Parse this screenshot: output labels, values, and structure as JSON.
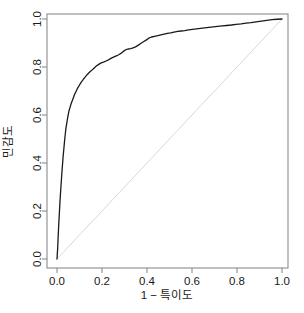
{
  "chart_data": {
    "type": "line",
    "title": "",
    "xlabel": "1 − 특이도",
    "ylabel": "민감도",
    "xlim": [
      0,
      1
    ],
    "ylim": [
      0,
      1
    ],
    "grid": false,
    "legend": "none",
    "xticks": [
      "0.0",
      "0.2",
      "0.4",
      "0.6",
      "0.8",
      "1.0"
    ],
    "xtick_values": [
      0.0,
      0.2,
      0.4,
      0.6,
      0.8,
      1.0
    ],
    "yticks": [
      "0.0",
      "0.2",
      "0.4",
      "0.6",
      "0.8",
      "1.0"
    ],
    "ytick_values": [
      0.0,
      0.2,
      0.4,
      0.6,
      0.8,
      1.0
    ],
    "series": [
      {
        "name": "roc-curve",
        "color": "#1a1a1a",
        "width": 1.3,
        "points": [
          [
            0.0,
            0.0
          ],
          [
            0.003,
            0.045
          ],
          [
            0.005,
            0.09
          ],
          [
            0.007,
            0.13
          ],
          [
            0.009,
            0.165
          ],
          [
            0.011,
            0.2
          ],
          [
            0.013,
            0.235
          ],
          [
            0.015,
            0.265
          ],
          [
            0.017,
            0.295
          ],
          [
            0.019,
            0.32
          ],
          [
            0.021,
            0.35
          ],
          [
            0.023,
            0.375
          ],
          [
            0.025,
            0.4
          ],
          [
            0.027,
            0.425
          ],
          [
            0.029,
            0.445
          ],
          [
            0.031,
            0.465
          ],
          [
            0.033,
            0.485
          ],
          [
            0.035,
            0.505
          ],
          [
            0.037,
            0.522
          ],
          [
            0.039,
            0.54
          ],
          [
            0.042,
            0.558
          ],
          [
            0.045,
            0.575
          ],
          [
            0.048,
            0.592
          ],
          [
            0.051,
            0.607
          ],
          [
            0.054,
            0.62
          ],
          [
            0.058,
            0.632
          ],
          [
            0.062,
            0.645
          ],
          [
            0.066,
            0.655
          ],
          [
            0.07,
            0.665
          ],
          [
            0.074,
            0.675
          ],
          [
            0.078,
            0.685
          ],
          [
            0.083,
            0.695
          ],
          [
            0.088,
            0.705
          ],
          [
            0.093,
            0.714
          ],
          [
            0.098,
            0.722
          ],
          [
            0.103,
            0.73
          ],
          [
            0.108,
            0.737
          ],
          [
            0.113,
            0.743
          ],
          [
            0.118,
            0.75
          ],
          [
            0.124,
            0.757
          ],
          [
            0.13,
            0.764
          ],
          [
            0.136,
            0.77
          ],
          [
            0.142,
            0.776
          ],
          [
            0.148,
            0.781
          ],
          [
            0.155,
            0.787
          ],
          [
            0.162,
            0.793
          ],
          [
            0.169,
            0.799
          ],
          [
            0.176,
            0.805
          ],
          [
            0.184,
            0.81
          ],
          [
            0.192,
            0.815
          ],
          [
            0.2,
            0.818
          ],
          [
            0.209,
            0.821
          ],
          [
            0.218,
            0.825
          ],
          [
            0.227,
            0.829
          ],
          [
            0.236,
            0.834
          ],
          [
            0.246,
            0.839
          ],
          [
            0.256,
            0.843
          ],
          [
            0.266,
            0.847
          ],
          [
            0.276,
            0.852
          ],
          [
            0.286,
            0.858
          ],
          [
            0.296,
            0.866
          ],
          [
            0.306,
            0.872
          ],
          [
            0.316,
            0.875
          ],
          [
            0.327,
            0.877
          ],
          [
            0.338,
            0.88
          ],
          [
            0.349,
            0.884
          ],
          [
            0.36,
            0.89
          ],
          [
            0.372,
            0.898
          ],
          [
            0.384,
            0.905
          ],
          [
            0.396,
            0.912
          ],
          [
            0.408,
            0.92
          ],
          [
            0.42,
            0.925
          ],
          [
            0.434,
            0.928
          ],
          [
            0.448,
            0.931
          ],
          [
            0.462,
            0.934
          ],
          [
            0.476,
            0.937
          ],
          [
            0.49,
            0.94
          ],
          [
            0.505,
            0.942
          ],
          [
            0.52,
            0.945
          ],
          [
            0.536,
            0.948
          ],
          [
            0.552,
            0.95
          ],
          [
            0.568,
            0.952
          ],
          [
            0.585,
            0.955
          ],
          [
            0.602,
            0.957
          ],
          [
            0.62,
            0.959
          ],
          [
            0.638,
            0.961
          ],
          [
            0.656,
            0.963
          ],
          [
            0.675,
            0.965
          ],
          [
            0.694,
            0.967
          ],
          [
            0.714,
            0.969
          ],
          [
            0.734,
            0.971
          ],
          [
            0.754,
            0.973
          ],
          [
            0.775,
            0.975
          ],
          [
            0.796,
            0.978
          ],
          [
            0.818,
            0.98
          ],
          [
            0.84,
            0.983
          ],
          [
            0.862,
            0.985
          ],
          [
            0.885,
            0.988
          ],
          [
            0.908,
            0.991
          ],
          [
            0.932,
            0.994
          ],
          [
            0.956,
            0.997
          ],
          [
            0.978,
            0.999
          ],
          [
            1.0,
            1.0
          ]
        ]
      },
      {
        "name": "chance-diagonal",
        "color": "#d9d9d9",
        "width": 1.0,
        "points": [
          [
            0.0,
            0.0
          ],
          [
            1.0,
            1.0
          ]
        ]
      }
    ]
  },
  "axes": {
    "frame_color": "#8c8c8c",
    "tick_color": "#8c8c8c",
    "text_color": "#1a1a1a",
    "background": "#ffffff"
  }
}
